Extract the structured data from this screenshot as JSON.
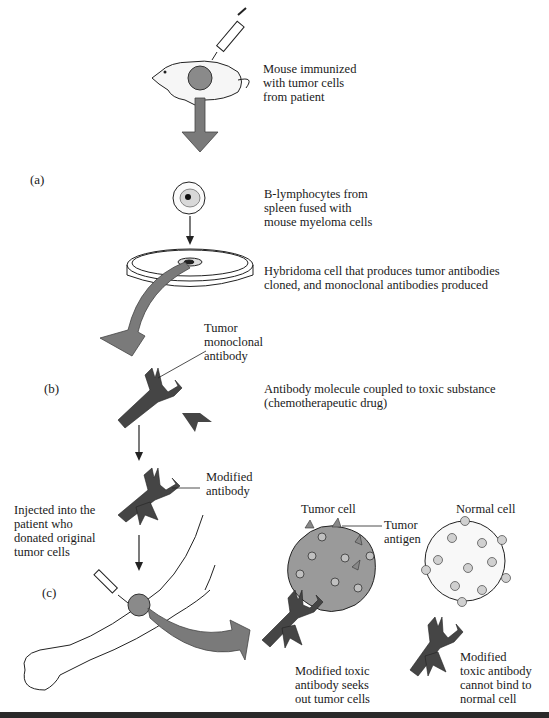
{
  "figure": {
    "parts": {
      "a": "(a)",
      "b": "(b)",
      "c": "(c)"
    },
    "steps": {
      "mouse": "Mouse immunized\nwith tumor cells\nfrom patient",
      "fusion": "B-lymphocytes from\nspleen fused with\nmouse myeloma cells",
      "hybridoma": "Hybridoma cell that produces tumor antibodies\ncloned, and monoclonal antibodies produced",
      "tumor_mab": "Tumor\nmonoclonal\nantibody",
      "coupling": "Antibody molecule coupled to toxic substance\n(chemotherapeutic drug)",
      "modified": "Modified\nantibody",
      "injected": "Injected into the\npatient who\ndonated original\ntumor cells",
      "tumor_cell": "Tumor cell",
      "tumor_antigen": "Tumor\nantigen",
      "normal_cell": "Normal cell",
      "seeks": "Modified toxic\nantibody seeks\nout tumor cells",
      "cannot_bind": "Modified\ntoxic antibody\ncannot bind to\nnormal cell"
    },
    "colors": {
      "arrow": "#7a7a7a",
      "antibody": "#454545",
      "tumor": "#9a9a9a",
      "antigen": "#c8c8c8"
    }
  }
}
